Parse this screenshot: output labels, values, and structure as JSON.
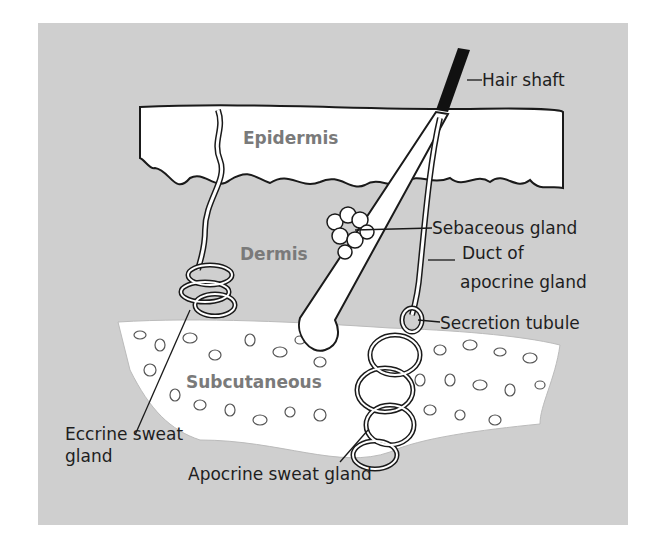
{
  "diagram": {
    "colors": {
      "background": "#cfcfcf",
      "tissue": "#ffffff",
      "line": "#1a1a1a",
      "region_label": "#7a7a7a",
      "hair": "#111111"
    },
    "regions": {
      "epidermis": "Epidermis",
      "dermis": "Dermis",
      "subcutaneous": "Subcutaneous"
    },
    "labels": {
      "hair_shaft": "Hair shaft",
      "sebaceous_gland": "Sebaceous gland",
      "duct_line1": "Duct of",
      "duct_line2": "apocrine gland",
      "secretion_tubule": "Secretion tubule",
      "eccrine_line1": "Eccrine sweat",
      "eccrine_line2": "gland",
      "apocrine_sweat_gland": "Apocrine sweat gland"
    }
  }
}
